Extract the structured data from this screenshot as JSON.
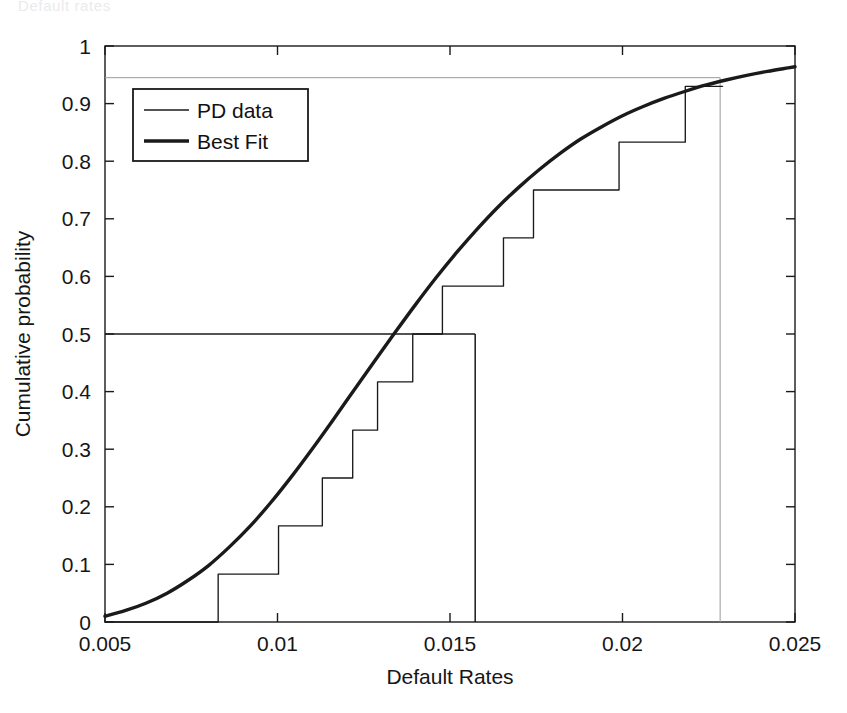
{
  "figure": {
    "artifact_text": "Default rates",
    "background": "#ffffff",
    "ink_color": "#1a1a1a",
    "faint_color": "#9a9a9a"
  },
  "chart_data": {
    "type": "line",
    "title": "",
    "subtitle": "",
    "xlabel": "Default Rates",
    "ylabel": "Cumulative probability",
    "xlim": [
      0.005,
      0.025
    ],
    "ylim": [
      0,
      1
    ],
    "xticks": [
      0.005,
      0.01,
      0.015,
      0.02,
      0.025
    ],
    "xtick_labels": [
      "0.005",
      "0.01",
      "0.015",
      "0.02",
      "0.025"
    ],
    "yticks": [
      0,
      0.1,
      0.2,
      0.3,
      0.4,
      0.5,
      0.6,
      0.7,
      0.8,
      0.9,
      1
    ],
    "ytick_labels": [
      "0",
      "0.1",
      "0.2",
      "0.3",
      "0.4",
      "0.5",
      "0.6",
      "0.7",
      "0.8",
      "0.9",
      "1"
    ],
    "grid": false,
    "legend_position": "upper-left",
    "legend_entries": [
      {
        "label": "PD data",
        "style": "thin",
        "color": "#1a1a1a",
        "width": 1.3
      },
      {
        "label": "Best Fit",
        "style": "thick",
        "color": "#1a1a1a",
        "width": 3.4
      }
    ],
    "series": [
      {
        "name": "PD data",
        "type": "step",
        "style": "thin",
        "color": "#1a1a1a",
        "x": [
          0.005,
          0.00828,
          0.01003,
          0.0113,
          0.01218,
          0.0129,
          0.01392,
          0.01478,
          0.01565,
          0.01655,
          0.01742,
          0.01822,
          0.0199,
          0.02088,
          0.02182,
          0.0229
        ],
        "y": [
          0.0,
          0.083,
          0.167,
          0.25,
          0.333,
          0.417,
          0.5,
          0.583,
          0.583,
          0.667,
          0.75,
          0.75,
          0.833,
          0.833,
          0.93,
          0.93
        ]
      },
      {
        "name": "Best Fit",
        "type": "curve",
        "style": "thick",
        "color": "#1a1a1a",
        "description": "Lognormal-like fitted cumulative distribution",
        "x": [
          0.005,
          0.0056,
          0.0062,
          0.0068,
          0.0074,
          0.008,
          0.0086,
          0.0092,
          0.0098,
          0.0104,
          0.011,
          0.0116,
          0.0122,
          0.0128,
          0.0134,
          0.014,
          0.0146,
          0.0152,
          0.0158,
          0.0164,
          0.017,
          0.0176,
          0.0182,
          0.0188,
          0.0194,
          0.02,
          0.0206,
          0.0212,
          0.0218,
          0.0224,
          0.023,
          0.0236,
          0.0242,
          0.0248,
          0.025
        ],
        "y": [
          0.01,
          0.02,
          0.033,
          0.05,
          0.072,
          0.098,
          0.13,
          0.166,
          0.207,
          0.252,
          0.3,
          0.35,
          0.401,
          0.452,
          0.502,
          0.551,
          0.598,
          0.642,
          0.683,
          0.721,
          0.755,
          0.786,
          0.814,
          0.839,
          0.86,
          0.879,
          0.895,
          0.909,
          0.921,
          0.932,
          0.941,
          0.949,
          0.956,
          0.962,
          0.964
        ]
      }
    ],
    "annotations": [
      {
        "name": "median-guide",
        "type": "crosshair",
        "style": "thin",
        "color": "#1a1a1a",
        "x": 0.01573,
        "y": 0.5,
        "horizontal_from_x": 0.005,
        "vertical_to_y": 0.0
      },
      {
        "name": "upper-percentile-guide",
        "type": "crosshair",
        "style": "faint",
        "color": "#9a9a9a",
        "x": 0.02283,
        "y": 0.945,
        "horizontal_from_x": 0.005,
        "vertical_to_y": 0.0
      }
    ]
  }
}
